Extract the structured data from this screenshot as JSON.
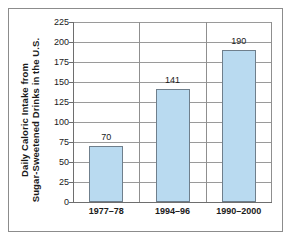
{
  "chart_data": {
    "type": "bar",
    "title": "",
    "subtitle": "",
    "xlabel": "",
    "ylabel_line1": "Daily Caloric Intake from",
    "ylabel_line2": "Sugar-Sweetened Drinks in the U.S.",
    "categories": [
      "1977–78",
      "1994–96",
      "1990–2000"
    ],
    "values": [
      70,
      141,
      190
    ],
    "data_labels": [
      "70",
      "141",
      "190"
    ],
    "ylim": [
      0,
      225
    ],
    "ytick_values": [
      0,
      25,
      50,
      75,
      100,
      125,
      150,
      175,
      200,
      225
    ],
    "ytick_labels": [
      "0",
      "25",
      "50",
      "75",
      "100",
      "125",
      "150",
      "175",
      "200",
      "225"
    ],
    "grid": "horizontal",
    "legend": "none",
    "colors": {
      "bar_fill": "#b9daf0",
      "bar_border": "#6f7f8c",
      "gridline": "#9a9a9a",
      "axis": "#6e6e6e",
      "frame": "#8c8c8c",
      "text": "#1a1a1a",
      "background": "#ffffff"
    }
  }
}
